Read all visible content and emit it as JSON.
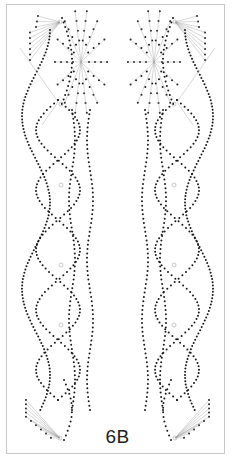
{
  "pattern": {
    "label": "6B",
    "dot_color": "#1a1a1a",
    "thread_color": "#9a9a9a",
    "hole_color": "#bdbdbd",
    "border_color": "#c8c8c8"
  }
}
